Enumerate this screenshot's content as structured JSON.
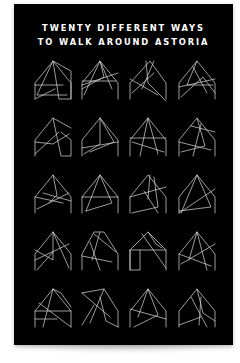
{
  "poster": {
    "title_line_1": "TWENTY DIFFERENT WAYS",
    "title_line_2": "TO WALK AROUND ASTORIA",
    "background_color": "#000000",
    "line_color": "#cfcfcf"
  },
  "grid": {
    "columns": 4,
    "rows": 5,
    "column_x": [
      19,
      66,
      114,
      163
    ],
    "row_y": [
      55,
      112,
      169,
      226,
      283
    ]
  },
  "walks": [
    {
      "name": "walk-1",
      "lines": [
        [
          2,
          40,
          2,
          24,
          20,
          2,
          38,
          24,
          38,
          40,
          26,
          40,
          20,
          2,
          4,
          36,
          34,
          36
        ],
        [
          2,
          26,
          30,
          26
        ],
        [
          20,
          2,
          38,
          12,
          38,
          40
        ],
        [
          2,
          40,
          22,
          30
        ]
      ]
    },
    {
      "name": "walk-2",
      "lines": [
        [
          2,
          40,
          2,
          24,
          20,
          2,
          38,
          24,
          38,
          40
        ],
        [
          2,
          26,
          38,
          14
        ],
        [
          4,
          36,
          20,
          2,
          32,
          30
        ],
        [
          2,
          22,
          36,
          22
        ],
        [
          20,
          2,
          24,
          18,
          2,
          30
        ]
      ]
    },
    {
      "name": "walk-3",
      "lines": [
        [
          2,
          40,
          2,
          24,
          22,
          2,
          38,
          24,
          38,
          40
        ],
        [
          18,
          2,
          20,
          24,
          38,
          42
        ],
        [
          26,
          2,
          14,
          30
        ],
        [
          4,
          34,
          26,
          14
        ],
        [
          2,
          20,
          30,
          36
        ]
      ]
    },
    {
      "name": "walk-4",
      "lines": [
        [
          2,
          40,
          2,
          24,
          20,
          2,
          38,
          24,
          38,
          40
        ],
        [
          20,
          2,
          10,
          26,
          36,
          26
        ],
        [
          4,
          38,
          26,
          18,
          38,
          34
        ],
        [
          16,
          8,
          30,
          34
        ],
        [
          2,
          28,
          38,
          20
        ]
      ]
    },
    {
      "name": "walk-5",
      "lines": [
        [
          2,
          40,
          2,
          24,
          20,
          2,
          38,
          12
        ],
        [
          20,
          2,
          28,
          40,
          38,
          40,
          38,
          24,
          28,
          16
        ],
        [
          2,
          38,
          26,
          16
        ],
        [
          2,
          26,
          20,
          28,
          36,
          18
        ]
      ]
    },
    {
      "name": "walk-6",
      "lines": [
        [
          2,
          40,
          2,
          24,
          20,
          2,
          38,
          24,
          38,
          40
        ],
        [
          20,
          2,
          20,
          28,
          4,
          38
        ],
        [
          2,
          32,
          38,
          26
        ],
        [
          20,
          2,
          34,
          26,
          10,
          36
        ]
      ]
    },
    {
      "name": "walk-7",
      "lines": [
        [
          2,
          40,
          2,
          24,
          20,
          2,
          38,
          24,
          38,
          40
        ],
        [
          2,
          22,
          38,
          22
        ],
        [
          20,
          2,
          12,
          40
        ],
        [
          4,
          26,
          36,
          36
        ],
        [
          20,
          2,
          30,
          38
        ]
      ]
    },
    {
      "name": "walk-8",
      "lines": [
        [
          2,
          40,
          2,
          24,
          20,
          2,
          38,
          24,
          38,
          40
        ],
        [
          14,
          10,
          38,
          16
        ],
        [
          2,
          26,
          34,
          34
        ],
        [
          20,
          2,
          28,
          30,
          4,
          36
        ],
        [
          24,
          8,
          16,
          40
        ]
      ]
    },
    {
      "name": "walk-9",
      "lines": [
        [
          2,
          40,
          2,
          24,
          20,
          2,
          38,
          24,
          38,
          40
        ],
        [
          4,
          36,
          36,
          20
        ],
        [
          2,
          24,
          30,
          30
        ],
        [
          20,
          2,
          24,
          22,
          16,
          30
        ],
        [
          10,
          20,
          38,
          28
        ]
      ]
    },
    {
      "name": "walk-10",
      "lines": [
        [
          2,
          40,
          2,
          24,
          20,
          2,
          38,
          24,
          38,
          40
        ],
        [
          2,
          24,
          38,
          24
        ],
        [
          20,
          2,
          6,
          38
        ],
        [
          20,
          2,
          32,
          30,
          6,
          38
        ]
      ]
    },
    {
      "name": "walk-11",
      "lines": [
        [
          2,
          40,
          2,
          24,
          20,
          2,
          38,
          24,
          38,
          40
        ],
        [
          26,
          4,
          30,
          34,
          4,
          40
        ],
        [
          2,
          24,
          38,
          14
        ],
        [
          16,
          18,
          30,
          40
        ],
        [
          22,
          2,
          20,
          26
        ]
      ]
    },
    {
      "name": "walk-12",
      "lines": [
        [
          2,
          40,
          2,
          24,
          20,
          2,
          38,
          24,
          38,
          40
        ],
        [
          20,
          2,
          4,
          40
        ],
        [
          38,
          16,
          2,
          40
        ],
        [
          20,
          2,
          34,
          34,
          2,
          38
        ]
      ]
    },
    {
      "name": "walk-13",
      "lines": [
        [
          2,
          40,
          2,
          24,
          20,
          2,
          38,
          24,
          38,
          40
        ],
        [
          20,
          2,
          20,
          30,
          2,
          20
        ],
        [
          2,
          30,
          36,
          14
        ],
        [
          20,
          2,
          36,
          38
        ],
        [
          20,
          22,
          4,
          40
        ]
      ]
    },
    {
      "name": "walk-14",
      "lines": [
        [
          2,
          40,
          2,
          24,
          14,
          2,
          24,
          2,
          38,
          24,
          38,
          40
        ],
        [
          10,
          12,
          20,
          40
        ],
        [
          14,
          4,
          36,
          22
        ],
        [
          2,
          26,
          32,
          32
        ],
        [
          20,
          2,
          12,
          30
        ]
      ]
    },
    {
      "name": "walk-15",
      "lines": [
        [
          2,
          40,
          2,
          20,
          20,
          2,
          38,
          20,
          38,
          40
        ],
        [
          2,
          20,
          38,
          20
        ],
        [
          2,
          20,
          2,
          40,
          12,
          40,
          12,
          20
        ],
        [
          14,
          4,
          38,
          38
        ],
        [
          20,
          2,
          28,
          14,
          34,
          18
        ]
      ]
    },
    {
      "name": "walk-16",
      "lines": [
        [
          2,
          40,
          2,
          24,
          20,
          2,
          38,
          24,
          38,
          40
        ],
        [
          20,
          2,
          12,
          30
        ],
        [
          4,
          34,
          38,
          14
        ],
        [
          20,
          2,
          30,
          40
        ],
        [
          2,
          24,
          34,
          36
        ]
      ]
    },
    {
      "name": "walk-17",
      "lines": [
        [
          2,
          40,
          2,
          24,
          20,
          2,
          38,
          24,
          38,
          40
        ],
        [
          20,
          2,
          28,
          6,
          38,
          20
        ],
        [
          2,
          24,
          38,
          24
        ],
        [
          2,
          32,
          24,
          32
        ],
        [
          20,
          2,
          10,
          40
        ],
        [
          6,
          16,
          38,
          40
        ]
      ]
    },
    {
      "name": "walk-18",
      "lines": [
        [
          2,
          6,
          24,
          2,
          38,
          24,
          38,
          40
        ],
        [
          24,
          2,
          10,
          36
        ],
        [
          2,
          6,
          30,
          30
        ],
        [
          14,
          18,
          2,
          38
        ],
        [
          20,
          10,
          26,
          34,
          38,
          40
        ]
      ]
    },
    {
      "name": "walk-19",
      "lines": [
        [
          2,
          40,
          2,
          24,
          20,
          2,
          38,
          24,
          38,
          40
        ],
        [
          2,
          22,
          38,
          32
        ],
        [
          20,
          2,
          30,
          28,
          6,
          40
        ],
        [
          20,
          2,
          10,
          30
        ]
      ]
    },
    {
      "name": "walk-20",
      "lines": [
        [
          2,
          40,
          2,
          24,
          20,
          2,
          38,
          24,
          38,
          40
        ],
        [
          20,
          2,
          26,
          26,
          38,
          34
        ],
        [
          14,
          10,
          30,
          40
        ],
        [
          2,
          38,
          24,
          30
        ],
        [
          24,
          10,
          22,
          38
        ]
      ]
    }
  ]
}
